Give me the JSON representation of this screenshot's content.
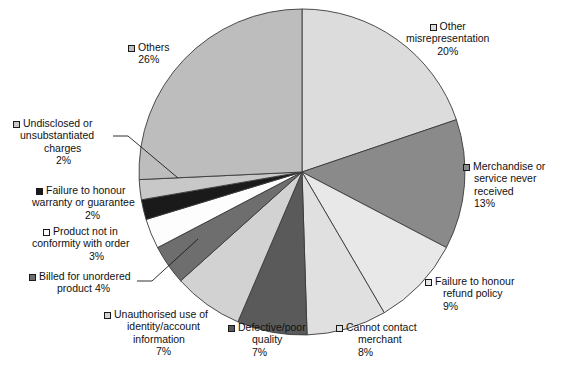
{
  "chart_data": {
    "type": "pie",
    "title": "",
    "subtitle": "",
    "xlabel": "",
    "ylabel": "",
    "legend_position": "labels-around-pie",
    "grid": false,
    "units": "%",
    "start_angle_deg": 0,
    "direction": "clockwise",
    "categories": [
      "Other misrepresentation",
      "Merchandise or service never received",
      "Failure to honour refund policy",
      "Cannot contact merchant",
      "Defective/poor quality",
      "Unauthorised use of identity/account information",
      "Billed for unordered product",
      "Product not in conformity with order",
      "Failure to honour warranty or guarantee",
      "Undisclosed or unsubstantiated charges",
      "Others"
    ],
    "values": [
      20,
      13,
      9,
      8,
      7,
      7,
      4,
      3,
      2,
      2,
      26
    ],
    "colors": [
      "#dcdcdc",
      "#8a8a8a",
      "#e8e8e8",
      "#e0e0e0",
      "#5a5a5a",
      "#d2d2d2",
      "#6e6e6e",
      "#fdfdfd",
      "#1a1a1a",
      "#c8c8c8",
      "#bdbdbd"
    ],
    "slices": [
      {
        "label": "Other misrepresentation",
        "value": 20,
        "pct": "20%",
        "color": "#dcdcdc"
      },
      {
        "label": "Merchandise or service never received",
        "value": 13,
        "pct": "13%",
        "color": "#8a8a8a"
      },
      {
        "label": "Failure to honour refund policy",
        "value": 9,
        "pct": "9%",
        "color": "#e8e8e8"
      },
      {
        "label": "Cannot contact merchant",
        "value": 8,
        "pct": "8%",
        "color": "#e0e0e0"
      },
      {
        "label": "Defective/poor quality",
        "value": 7,
        "pct": "7%",
        "color": "#5a5a5a"
      },
      {
        "label": "Unauthorised use of identity/account information",
        "value": 7,
        "pct": "7%",
        "color": "#d2d2d2"
      },
      {
        "label": "Billed for unordered product",
        "value": 4,
        "pct": "4%",
        "color": "#6e6e6e"
      },
      {
        "label": "Product not in conformity with order",
        "value": 3,
        "pct": "3%",
        "color": "#fdfdfd"
      },
      {
        "label": "Failure to honour warranty or guarantee",
        "value": 2,
        "pct": "2%",
        "color": "#1a1a1a"
      },
      {
        "label": "Undisclosed or unsubstantiated charges",
        "value": 2,
        "pct": "2%",
        "color": "#c8c8c8"
      },
      {
        "label": "Others",
        "value": 26,
        "pct": "26%",
        "color": "#bdbdbd"
      }
    ]
  },
  "labels": {
    "others": {
      "l1": "Others",
      "l2": "26%"
    },
    "other_misrepresentation": {
      "l1": "Other",
      "l2": "misrepresentation",
      "l3": "20%"
    },
    "merchandise": {
      "l1": "Merchandise or",
      "l2": "service never",
      "l3": "received",
      "l4": "13%"
    },
    "refund_policy": {
      "l1": "Failure to honour",
      "l2": "refund policy",
      "l3": "9%"
    },
    "cannot_contact": {
      "l1": "Cannot contact",
      "l2": "merchant",
      "l3": "8%"
    },
    "defective": {
      "l1": "Defective/poor",
      "l2": "quality",
      "l3": "7%"
    },
    "unauthorised": {
      "l1": "Unauthorised use of",
      "l2": "identity/account",
      "l3": "information",
      "l4": "7%"
    },
    "billed_unordered": {
      "l1": "Billed for unordered",
      "l2": "product 4%"
    },
    "not_conformity": {
      "l1": "Product not in",
      "l2": "conformity with order",
      "l3": "3%"
    },
    "warranty": {
      "l1": "Failure to honour",
      "l2": "warranty or guarantee",
      "l3": "2%"
    },
    "undisclosed": {
      "l1": "Undisclosed or",
      "l2": "unsubstantiated",
      "l3": "charges",
      "l4": "2%"
    }
  }
}
